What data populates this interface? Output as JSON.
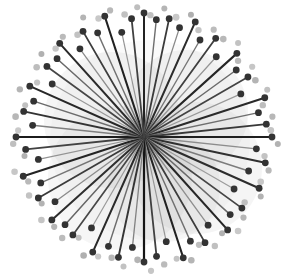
{
  "figure": {
    "title": "",
    "width": 292,
    "height": 275,
    "background_color": "#ffffff"
  },
  "chart_data": {
    "type": "scatter",
    "title": "",
    "subtitle": "",
    "xlabel": "",
    "ylabel": "",
    "grid": false,
    "legend": "none",
    "annotations": [],
    "center": {
      "x": 144,
      "y": 137
    },
    "xlim": [
      0,
      292
    ],
    "ylim": [
      0,
      275
    ],
    "tick_labels_x": [],
    "tick_labels_y": [],
    "colors": {
      "spoke_dark": "#2b2b2b",
      "spoke_mid": "#555555",
      "spoke_light": "#8d8d8d",
      "marker_dark": "#333333",
      "marker_light": "#bdbdbd",
      "blob_fill": "#9a9a9a",
      "background": "#ffffff"
    },
    "blobs": [
      {
        "cx": 112,
        "cy": 120,
        "r": 68,
        "opacity": 0.1
      },
      {
        "cx": 186,
        "cy": 112,
        "r": 62,
        "opacity": 0.1
      },
      {
        "cx": 196,
        "cy": 168,
        "r": 66,
        "opacity": 0.1
      },
      {
        "cx": 120,
        "cy": 178,
        "r": 72,
        "opacity": 0.09
      },
      {
        "cx": 164,
        "cy": 186,
        "r": 56,
        "opacity": 0.09
      },
      {
        "cx": 150,
        "cy": 140,
        "r": 100,
        "opacity": 0.05
      }
    ],
    "spokes": [
      {
        "angle": 270,
        "radius": 124,
        "shade": "#232323",
        "width": 2.0
      },
      {
        "angle": 276,
        "radius": 118,
        "shade": "#6e6e6e",
        "width": 1.4
      },
      {
        "angle": 282,
        "radius": 121,
        "shade": "#3a3a3a",
        "width": 1.8
      },
      {
        "angle": 288,
        "radius": 115,
        "shade": "#8a8a8a",
        "width": 1.3
      },
      {
        "angle": 294,
        "radius": 126,
        "shade": "#2c2c2c",
        "width": 2.0
      },
      {
        "angle": 300,
        "radius": 112,
        "shade": "#777777",
        "width": 1.4
      },
      {
        "angle": 306,
        "radius": 122,
        "shade": "#3f3f3f",
        "width": 1.8
      },
      {
        "angle": 312,
        "radius": 108,
        "shade": "#949494",
        "width": 1.2
      },
      {
        "angle": 318,
        "radius": 125,
        "shade": "#262626",
        "width": 2.1
      },
      {
        "angle": 324,
        "radius": 114,
        "shade": "#6b6b6b",
        "width": 1.5
      },
      {
        "angle": 330,
        "radius": 120,
        "shade": "#434343",
        "width": 1.7
      },
      {
        "angle": 336,
        "radius": 106,
        "shade": "#999999",
        "width": 1.2
      },
      {
        "angle": 342,
        "radius": 127,
        "shade": "#2a2a2a",
        "width": 2.0
      },
      {
        "angle": 348,
        "radius": 117,
        "shade": "#6f6f6f",
        "width": 1.4
      },
      {
        "angle": 354,
        "radius": 123,
        "shade": "#383838",
        "width": 1.9
      },
      {
        "angle": 0,
        "radius": 128,
        "shade": "#1f1f1f",
        "width": 2.2
      },
      {
        "angle": 6,
        "radius": 113,
        "shade": "#8d8d8d",
        "width": 1.3
      },
      {
        "angle": 12,
        "radius": 124,
        "shade": "#303030",
        "width": 1.9
      },
      {
        "angle": 18,
        "radius": 110,
        "shade": "#7c7c7c",
        "width": 1.4
      },
      {
        "angle": 24,
        "radius": 126,
        "shade": "#2d2d2d",
        "width": 2.0
      },
      {
        "angle": 30,
        "radius": 104,
        "shade": "#9c9c9c",
        "width": 1.2
      },
      {
        "angle": 36,
        "radius": 121,
        "shade": "#454545",
        "width": 1.7
      },
      {
        "angle": 42,
        "radius": 116,
        "shade": "#6a6a6a",
        "width": 1.5
      },
      {
        "angle": 48,
        "radius": 125,
        "shade": "#272727",
        "width": 2.1
      },
      {
        "angle": 54,
        "radius": 109,
        "shade": "#8f8f8f",
        "width": 1.3
      },
      {
        "angle": 60,
        "radius": 122,
        "shade": "#3c3c3c",
        "width": 1.8
      },
      {
        "angle": 66,
        "radius": 114,
        "shade": "#717171",
        "width": 1.4
      },
      {
        "angle": 72,
        "radius": 127,
        "shade": "#222222",
        "width": 2.1
      },
      {
        "angle": 78,
        "radius": 107,
        "shade": "#979797",
        "width": 1.2
      },
      {
        "angle": 84,
        "radius": 120,
        "shade": "#404040",
        "width": 1.8
      },
      {
        "angle": 90,
        "radius": 125,
        "shade": "#151515",
        "width": 2.2
      },
      {
        "angle": 96,
        "radius": 111,
        "shade": "#828282",
        "width": 1.3
      },
      {
        "angle": 102,
        "radius": 123,
        "shade": "#343434",
        "width": 1.9
      },
      {
        "angle": 108,
        "radius": 115,
        "shade": "#6d6d6d",
        "width": 1.5
      },
      {
        "angle": 114,
        "radius": 126,
        "shade": "#292929",
        "width": 2.0
      },
      {
        "angle": 120,
        "radius": 105,
        "shade": "#9a9a9a",
        "width": 1.2
      },
      {
        "angle": 126,
        "radius": 121,
        "shade": "#474747",
        "width": 1.7
      },
      {
        "angle": 132,
        "radius": 118,
        "shade": "#666666",
        "width": 1.5
      },
      {
        "angle": 138,
        "radius": 124,
        "shade": "#2e2e2e",
        "width": 2.0
      },
      {
        "angle": 144,
        "radius": 110,
        "shade": "#8b8b8b",
        "width": 1.3
      },
      {
        "angle": 150,
        "radius": 122,
        "shade": "#3b3b3b",
        "width": 1.8
      },
      {
        "angle": 156,
        "radius": 113,
        "shade": "#757575",
        "width": 1.4
      },
      {
        "angle": 162,
        "radius": 127,
        "shade": "#242424",
        "width": 2.1
      },
      {
        "angle": 168,
        "radius": 108,
        "shade": "#939393",
        "width": 1.2
      },
      {
        "angle": 174,
        "radius": 119,
        "shade": "#424242",
        "width": 1.8
      },
      {
        "angle": 180,
        "radius": 128,
        "shade": "#1c1c1c",
        "width": 2.2
      },
      {
        "angle": 186,
        "radius": 112,
        "shade": "#808080",
        "width": 1.4
      },
      {
        "angle": 192,
        "radius": 123,
        "shade": "#333333",
        "width": 1.9
      },
      {
        "angle": 198,
        "radius": 116,
        "shade": "#6c6c6c",
        "width": 1.5
      },
      {
        "angle": 204,
        "radius": 125,
        "shade": "#282828",
        "width": 2.0
      },
      {
        "angle": 210,
        "radius": 106,
        "shade": "#989898",
        "width": 1.2
      },
      {
        "angle": 216,
        "radius": 120,
        "shade": "#464646",
        "width": 1.7
      },
      {
        "angle": 222,
        "radius": 117,
        "shade": "#696969",
        "width": 1.5
      },
      {
        "angle": 228,
        "radius": 126,
        "shade": "#2b2b2b",
        "width": 2.0
      },
      {
        "angle": 234,
        "radius": 109,
        "shade": "#8e8e8e",
        "width": 1.3
      },
      {
        "angle": 240,
        "radius": 122,
        "shade": "#3d3d3d",
        "width": 1.8
      },
      {
        "angle": 246,
        "radius": 114,
        "shade": "#737373",
        "width": 1.4
      },
      {
        "angle": 252,
        "radius": 127,
        "shade": "#212121",
        "width": 2.1
      },
      {
        "angle": 258,
        "radius": 107,
        "shade": "#959595",
        "width": 1.2
      },
      {
        "angle": 264,
        "radius": 119,
        "shade": "#414141",
        "width": 1.8
      }
    ],
    "outer_markers": [
      {
        "angle": 273,
        "radius": 122,
        "r": 3.2,
        "color": "#c0c0c0"
      },
      {
        "angle": 279,
        "radius": 130,
        "r": 3.0,
        "color": "#b5b5b5"
      },
      {
        "angle": 285,
        "radius": 124,
        "r": 3.4,
        "color": "#c8c8c8"
      },
      {
        "angle": 291,
        "radius": 131,
        "r": 3.0,
        "color": "#b0b0b0"
      },
      {
        "angle": 297,
        "radius": 120,
        "r": 3.2,
        "color": "#c4c4c4"
      },
      {
        "angle": 303,
        "radius": 128,
        "r": 3.1,
        "color": "#bcbcbc"
      },
      {
        "angle": 309,
        "radius": 126,
        "r": 3.3,
        "color": "#b8b8b8"
      },
      {
        "angle": 315,
        "radius": 133,
        "r": 3.0,
        "color": "#c2c2c2"
      },
      {
        "angle": 321,
        "radius": 121,
        "r": 3.2,
        "color": "#bababa"
      },
      {
        "angle": 327,
        "radius": 129,
        "r": 3.1,
        "color": "#c6c6c6"
      },
      {
        "angle": 333,
        "radius": 125,
        "r": 3.3,
        "color": "#b4b4b4"
      },
      {
        "angle": 339,
        "radius": 132,
        "r": 3.0,
        "color": "#c1c1c1"
      },
      {
        "angle": 345,
        "radius": 123,
        "r": 3.2,
        "color": "#bdbdbd"
      },
      {
        "angle": 351,
        "radius": 130,
        "r": 3.1,
        "color": "#b7b7b7"
      },
      {
        "angle": 357,
        "radius": 127,
        "r": 3.3,
        "color": "#c5c5c5"
      },
      {
        "angle": 3,
        "radius": 134,
        "r": 3.0,
        "color": "#b2b2b2"
      },
      {
        "angle": 9,
        "radius": 122,
        "r": 3.2,
        "color": "#c3c3c3"
      },
      {
        "angle": 15,
        "radius": 129,
        "r": 3.1,
        "color": "#b9b9b9"
      },
      {
        "angle": 21,
        "radius": 125,
        "r": 3.3,
        "color": "#c7c7c7"
      },
      {
        "angle": 27,
        "radius": 131,
        "r": 3.0,
        "color": "#b3b3b3"
      },
      {
        "angle": 33,
        "radius": 120,
        "r": 3.2,
        "color": "#bfbfbf"
      },
      {
        "angle": 39,
        "radius": 128,
        "r": 3.1,
        "color": "#b6b6b6"
      },
      {
        "angle": 45,
        "radius": 133,
        "r": 3.3,
        "color": "#c9c9c9"
      },
      {
        "angle": 51,
        "radius": 124,
        "r": 3.0,
        "color": "#b1b1b1"
      },
      {
        "angle": 57,
        "radius": 130,
        "r": 3.2,
        "color": "#c0c0c0"
      },
      {
        "angle": 63,
        "radius": 121,
        "r": 3.1,
        "color": "#bebebe"
      },
      {
        "angle": 69,
        "radius": 132,
        "r": 3.3,
        "color": "#b5b5b5"
      },
      {
        "angle": 75,
        "radius": 126,
        "r": 3.0,
        "color": "#c4c4c4"
      },
      {
        "angle": 81,
        "radius": 129,
        "r": 3.2,
        "color": "#bbbbbb"
      },
      {
        "angle": 87,
        "radius": 134,
        "r": 3.1,
        "color": "#c6c6c6"
      },
      {
        "angle": 93,
        "radius": 123,
        "r": 3.3,
        "color": "#b4b4b4"
      },
      {
        "angle": 99,
        "radius": 131,
        "r": 3.0,
        "color": "#c2c2c2"
      },
      {
        "angle": 105,
        "radius": 125,
        "r": 3.2,
        "color": "#b8b8b8"
      },
      {
        "angle": 111,
        "radius": 128,
        "r": 3.1,
        "color": "#c8c8c8"
      },
      {
        "angle": 117,
        "radius": 133,
        "r": 3.3,
        "color": "#b0b0b0"
      },
      {
        "angle": 123,
        "radius": 120,
        "r": 3.0,
        "color": "#c1c1c1"
      },
      {
        "angle": 129,
        "radius": 130,
        "r": 3.2,
        "color": "#bcbcbc"
      },
      {
        "angle": 135,
        "radius": 127,
        "r": 3.1,
        "color": "#b6b6b6"
      },
      {
        "angle": 141,
        "radius": 132,
        "r": 3.3,
        "color": "#c5c5c5"
      },
      {
        "angle": 147,
        "radius": 122,
        "r": 3.0,
        "color": "#b3b3b3"
      },
      {
        "angle": 153,
        "radius": 129,
        "r": 3.2,
        "color": "#c3c3c3"
      },
      {
        "angle": 159,
        "radius": 124,
        "r": 3.1,
        "color": "#b9b9b9"
      },
      {
        "angle": 165,
        "radius": 134,
        "r": 3.3,
        "color": "#c7c7c7"
      },
      {
        "angle": 171,
        "radius": 121,
        "r": 3.0,
        "color": "#b2b2b2"
      },
      {
        "angle": 177,
        "radius": 131,
        "r": 3.2,
        "color": "#bfbfbf"
      },
      {
        "angle": 183,
        "radius": 126,
        "r": 3.1,
        "color": "#c9c9c9"
      },
      {
        "angle": 189,
        "radius": 130,
        "r": 3.3,
        "color": "#b7b7b7"
      },
      {
        "angle": 195,
        "radius": 123,
        "r": 3.0,
        "color": "#c0c0c0"
      },
      {
        "angle": 201,
        "radius": 133,
        "r": 3.2,
        "color": "#b5b5b5"
      },
      {
        "angle": 207,
        "radius": 120,
        "r": 3.1,
        "color": "#c4c4c4"
      },
      {
        "angle": 213,
        "radius": 128,
        "r": 3.3,
        "color": "#bdbdbd"
      },
      {
        "angle": 219,
        "radius": 132,
        "r": 3.0,
        "color": "#b1b1b1"
      },
      {
        "angle": 225,
        "radius": 125,
        "r": 3.2,
        "color": "#c6c6c6"
      },
      {
        "angle": 231,
        "radius": 129,
        "r": 3.1,
        "color": "#bababa"
      },
      {
        "angle": 237,
        "radius": 122,
        "r": 3.3,
        "color": "#c2c2c2"
      },
      {
        "angle": 243,
        "radius": 134,
        "r": 3.0,
        "color": "#b4b4b4"
      },
      {
        "angle": 249,
        "radius": 127,
        "r": 3.2,
        "color": "#c8c8c8"
      },
      {
        "angle": 255,
        "radius": 131,
        "r": 3.1,
        "color": "#b8b8b8"
      },
      {
        "angle": 261,
        "radius": 124,
        "r": 3.3,
        "color": "#c1c1c1"
      },
      {
        "angle": 267,
        "radius": 130,
        "r": 3.0,
        "color": "#bebebe"
      }
    ]
  }
}
